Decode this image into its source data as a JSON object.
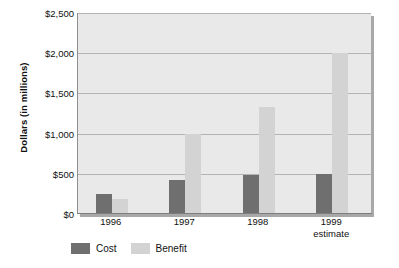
{
  "chart_data": {
    "type": "bar",
    "title": "",
    "subtitle": "",
    "xlabel": "",
    "ylabel": "Dollars (in millions)",
    "categories": [
      "1996",
      "1997",
      "1998",
      "1999"
    ],
    "category_sublabels": [
      "",
      "",
      "",
      "estimate"
    ],
    "series": [
      {
        "name": "Cost",
        "color": "#706f6f",
        "values": [
          250,
          420,
          490,
          500
        ]
      },
      {
        "name": "Benefit",
        "color": "#d3d3d3",
        "values": [
          190,
          1000,
          1330,
          2000
        ]
      }
    ],
    "ylim": [
      0,
      2500
    ],
    "ytick_values": [
      0,
      500,
      1000,
      1500,
      2000,
      2500
    ],
    "ytick_labels": [
      "$0",
      "$500",
      "$1,000",
      "$1,500",
      "$2,000",
      "$2,500"
    ],
    "grid": true,
    "grid_axis": "y",
    "legend_position": "bottom-left",
    "plot_background": "#e9e9e9",
    "gridline_color": "#b3b3b3",
    "axis_color": "#7d7d7d"
  }
}
